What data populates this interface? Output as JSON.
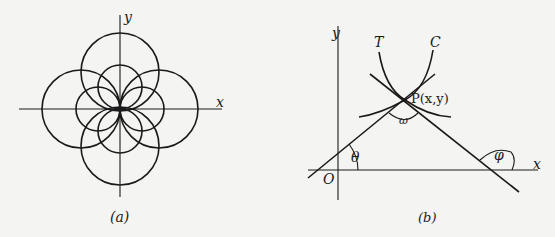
{
  "panel_a": {
    "caption": "(a)",
    "x_label": "x",
    "y_label": "y",
    "description": "Two families of circles through the origin, tangent at the origin: four large circles centered on the axes and four small circles centered on the axes"
  },
  "panel_b": {
    "caption": "(b)",
    "x_label": "x",
    "y_label": "y",
    "origin_label": "O",
    "curve_t_label": "T",
    "curve_c_label": "C",
    "point_label": "P(x,y)",
    "angle_omega": "ω",
    "angle_theta": "θ",
    "angle_phi": "φ",
    "description": "Two curves T and C intersecting at P(x,y) with tangent lines making angles θ and φ with the x-axis; ω is the angle between the tangents"
  }
}
